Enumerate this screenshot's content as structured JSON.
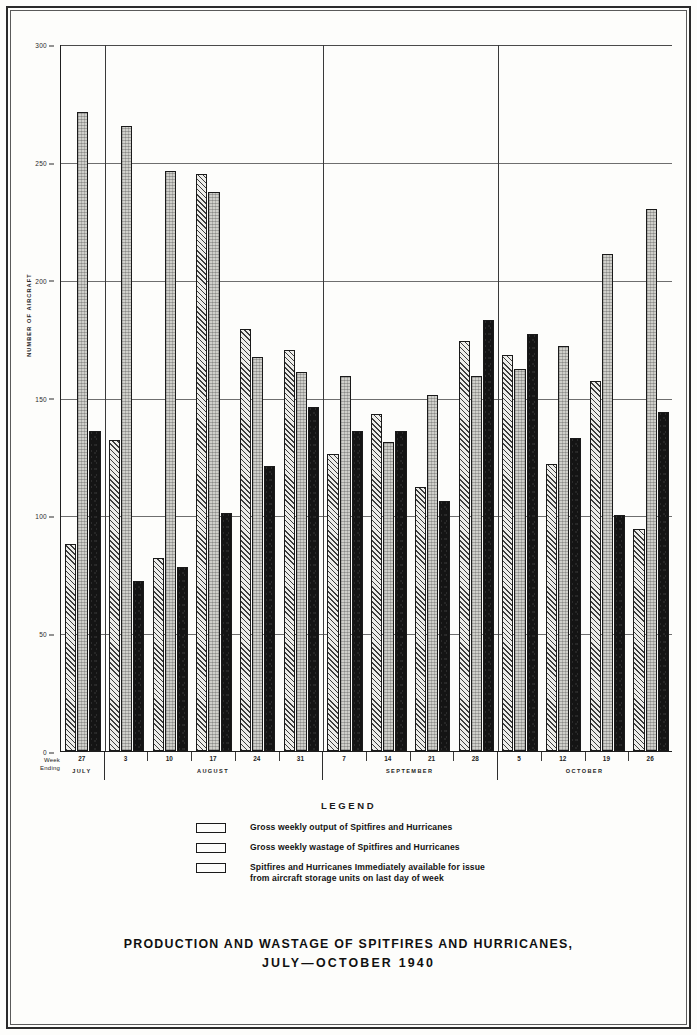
{
  "chart_data": {
    "type": "bar",
    "title": "PRODUCTION AND WASTAGE OF SPITFIRES AND HURRICANES,",
    "subtitle": "JULY—OCTOBER 1940",
    "xlabel": "Week Ending",
    "ylabel": "NUMBER OF AIRCRAFT",
    "ylim": [
      0,
      300
    ],
    "yticks": [
      0,
      50,
      100,
      150,
      200,
      250,
      300
    ],
    "grid": true,
    "legend_position": "below",
    "legend_title": "LEGEND",
    "categories": [
      "27",
      "3",
      "10",
      "17",
      "24",
      "31",
      "7",
      "14",
      "21",
      "28",
      "5",
      "12",
      "19",
      "26"
    ],
    "months": [
      {
        "name": "JULY",
        "weeks": [
          "27"
        ]
      },
      {
        "name": "AUGUST",
        "weeks": [
          "3",
          "10",
          "17",
          "24",
          "31"
        ]
      },
      {
        "name": "SEPTEMBER",
        "weeks": [
          "7",
          "14",
          "21",
          "28"
        ]
      },
      {
        "name": "OCTOBER",
        "weeks": [
          "5",
          "12",
          "19",
          "26"
        ]
      }
    ],
    "series": [
      {
        "name": "Gross weekly output of Spitfires and Hurricanes",
        "key": "output",
        "pattern": "solid-black",
        "color": "#141414",
        "values": [
          136,
          72,
          78,
          101,
          121,
          146,
          136,
          136,
          106,
          183,
          177,
          133,
          100,
          144
        ]
      },
      {
        "name": "Gross weekly wastage of Spitfires and Hurricanes",
        "key": "wastage",
        "pattern": "diagonal-hatch",
        "color": "#3d3d3d",
        "values": [
          88,
          132,
          82,
          245,
          179,
          170,
          126,
          143,
          112,
          174,
          168,
          122,
          157,
          94
        ]
      },
      {
        "name": "Spitfires and Hurricanes Immediately available for issue from aircraft storage units on last day of week",
        "key": "available",
        "pattern": "stipple-grey",
        "color": "#cfcfca",
        "values": [
          271,
          265,
          246,
          237,
          167,
          161,
          159,
          131,
          151,
          159,
          162,
          172,
          211,
          230
        ]
      }
    ]
  },
  "legend": {
    "title": "LEGEND",
    "entries": [
      {
        "swatch": "solid-black-swatch",
        "line1": "Gross weekly output of Spitfires and Hurricanes",
        "line2": ""
      },
      {
        "swatch": "hatched-swatch",
        "line1": "Gross weekly wastage of Spitfires and Hurricanes",
        "line2": ""
      },
      {
        "swatch": "stipple-swatch",
        "line1": "Spitfires and Hurricanes Immediately available for issue",
        "line2": "from aircraft storage units on last day of week"
      }
    ]
  },
  "axes": {
    "y_title": "NUMBER OF AIRCRAFT",
    "x_title_line1": "Week",
    "x_title_line2": "Ending"
  },
  "title": {
    "line1": "PRODUCTION AND WASTAGE OF SPITFIRES AND HURRICANES,",
    "line2": "JULY—OCTOBER 1940"
  }
}
